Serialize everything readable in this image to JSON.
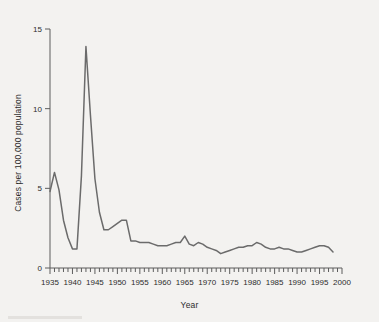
{
  "chart_data": {
    "type": "line",
    "title": "",
    "xlabel": "Year",
    "ylabel": "Cases per 100,000 population",
    "xlim": [
      1935,
      2000
    ],
    "ylim": [
      0,
      15
    ],
    "grid": false,
    "legend": null,
    "y_ticks": [
      0,
      5,
      10,
      15
    ],
    "y_tick_labels": [
      "0",
      "5",
      "10",
      "15"
    ],
    "x_ticks": [
      1935,
      1940,
      1945,
      1950,
      1955,
      1960,
      1965,
      1970,
      1975,
      1980,
      1985,
      1990,
      1995,
      2000
    ],
    "x_tick_labels": [
      "1935",
      "1940",
      "1945",
      "1950",
      "1955",
      "1960",
      "1965",
      "1970",
      "1975",
      "1980",
      "1985",
      "1990",
      "1995",
      "2000"
    ],
    "x_minor_tick_step": 1,
    "line_color": "#6b6b6b",
    "background_color": "#f3f2f0",
    "series": [
      {
        "name": "Cases per 100,000 population",
        "x": [
          1935,
          1936,
          1937,
          1938,
          1939,
          1940,
          1941,
          1942,
          1943,
          1944,
          1945,
          1946,
          1947,
          1948,
          1949,
          1950,
          1951,
          1952,
          1953,
          1954,
          1955,
          1956,
          1957,
          1958,
          1959,
          1960,
          1961,
          1962,
          1963,
          1964,
          1965,
          1966,
          1967,
          1968,
          1969,
          1970,
          1971,
          1972,
          1973,
          1974,
          1975,
          1976,
          1977,
          1978,
          1979,
          1980,
          1981,
          1982,
          1983,
          1984,
          1985,
          1986,
          1987,
          1988,
          1989,
          1990,
          1991,
          1992,
          1993,
          1994,
          1995,
          1996,
          1997,
          1998
        ],
        "y": [
          4.8,
          6.0,
          4.9,
          3.0,
          1.9,
          1.2,
          1.2,
          5.8,
          13.9,
          9.6,
          5.6,
          3.5,
          2.4,
          2.4,
          2.6,
          2.8,
          3.0,
          3.0,
          1.7,
          1.7,
          1.6,
          1.6,
          1.6,
          1.5,
          1.4,
          1.4,
          1.4,
          1.5,
          1.6,
          1.6,
          2.0,
          1.5,
          1.4,
          1.6,
          1.5,
          1.3,
          1.2,
          1.1,
          0.9,
          1.0,
          1.1,
          1.2,
          1.3,
          1.3,
          1.4,
          1.4,
          1.6,
          1.5,
          1.3,
          1.2,
          1.2,
          1.3,
          1.2,
          1.2,
          1.1,
          1.0,
          1.0,
          1.1,
          1.2,
          1.3,
          1.4,
          1.4,
          1.3,
          1.0
        ]
      }
    ]
  },
  "axes": {
    "x_title": "Year",
    "y_title": "Cases per 100,000 population"
  }
}
